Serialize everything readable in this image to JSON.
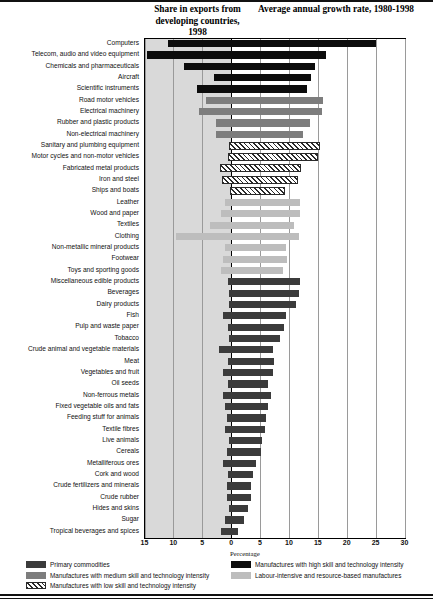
{
  "header": {
    "share_title": "Share in exports from developing countries, 1998",
    "growth_title": "Average annual growth rate, 1980-1998"
  },
  "axis": {
    "xlabel": "Percentage",
    "ticks": [
      "15",
      "10",
      "5",
      "0",
      "5",
      "10",
      "15",
      "20",
      "25",
      "30"
    ],
    "tick_values": [
      -15,
      -10,
      -5,
      0,
      5,
      10,
      15,
      20,
      25,
      30
    ],
    "xlim": [
      -15,
      30
    ]
  },
  "legend": {
    "items": [
      {
        "label": "Primary commodities",
        "key": "primary",
        "color": "#3b3b3b"
      },
      {
        "label": "Manufactures with high skill and technology intensity",
        "key": "high",
        "color": "#0c0c0c"
      },
      {
        "label": "Manufactures with medium skill and technology intensity",
        "key": "medium",
        "color": "#7d7d7d"
      },
      {
        "label": "Labour-intensive and resource-based manufactures",
        "key": "labour",
        "color": "#bdbdbd"
      },
      {
        "label": "Manufactures with low skill and technology intensity",
        "key": "low",
        "color": "#2a2a2a"
      }
    ]
  },
  "chart_data": {
    "type": "bar",
    "xlabel": "Percentage",
    "ylabel": "",
    "xlim": [
      -15,
      30
    ],
    "grid": true,
    "orientation": "horizontal",
    "legend_position": "bottom",
    "note": "Each bar spans from the negative share-in-exports value (left, shaded band) to the positive average annual growth rate (right).",
    "categories": [
      "Computers",
      "Telecom, audio and video equipment",
      "Chemicals and pharmaceuticals",
      "Aircraft",
      "Scientific instruments",
      "Road motor vehicles",
      "Electrical machinery",
      "Rubber and plastic products",
      "Non-electrical machinery",
      "Sanitary and plumbing equipment",
      "Motor cycles and non-motor vehicles",
      "Fabricated metal products",
      "Iron and steel",
      "Ships and boats",
      "Leather",
      "Wood and paper",
      "Textiles",
      "Clothing",
      "Non-metallic mineral products",
      "Footwear",
      "Toys and sporting goods",
      "Miscellaneous edible products",
      "Beverages",
      "Dairy products",
      "Fish",
      "Pulp and waste paper",
      "Tobacco",
      "Crude animal and vegetable materials",
      "Meat",
      "Vegetables and fruit",
      "Oil seeds",
      "Non-ferrous metals",
      "Fixed vegetable oils and fats",
      "Feeding stuff for animals",
      "Textile fibres",
      "Live animals",
      "Cereals",
      "Metalliferous ores",
      "Cork and wood",
      "Crude fertilizers and minerals",
      "Crude rubber",
      "Hides and skins",
      "Sugar",
      "Tropical beverages and spices"
    ],
    "series": [
      {
        "name": "Share in exports from developing countries, 1998",
        "units": "percent",
        "values": [
          11.0,
          14.5,
          8.2,
          3.0,
          6.0,
          4.3,
          5.5,
          2.6,
          2.6,
          0.4,
          0.6,
          2.0,
          1.6,
          0.2,
          1.0,
          1.8,
          3.7,
          9.5,
          1.1,
          1.5,
          1.8,
          0.5,
          0.4,
          0.4,
          1.4,
          0.5,
          0.3,
          2.1,
          0.6,
          1.5,
          0.5,
          1.4,
          1.0,
          0.7,
          1.0,
          0.3,
          0.7,
          1.5,
          0.5,
          0.7,
          0.8,
          0.4,
          1.0,
          1.7
        ]
      },
      {
        "name": "Average annual growth rate, 1980-1998",
        "units": "percent per year",
        "values": [
          25.0,
          16.4,
          14.5,
          13.8,
          13.2,
          15.9,
          15.8,
          13.7,
          12.4,
          15.3,
          15.0,
          12.1,
          11.6,
          9.4,
          11.9,
          11.9,
          10.8,
          11.8,
          9.5,
          9.6,
          8.9,
          11.9,
          11.8,
          11.3,
          9.5,
          9.2,
          8.4,
          7.3,
          7.5,
          7.3,
          6.3,
          6.9,
          6.3,
          6.0,
          5.9,
          5.3,
          5.1,
          4.3,
          3.7,
          3.4,
          3.4,
          2.9,
          2.3,
          1.1
        ]
      }
    ],
    "category_class": [
      "high",
      "high",
      "high",
      "high",
      "high",
      "medium",
      "medium",
      "medium",
      "medium",
      "low",
      "low",
      "low",
      "low",
      "low",
      "labour",
      "labour",
      "labour",
      "labour",
      "labour",
      "labour",
      "labour",
      "primary",
      "primary",
      "primary",
      "primary",
      "primary",
      "primary",
      "primary",
      "primary",
      "primary",
      "primary",
      "primary",
      "primary",
      "primary",
      "primary",
      "primary",
      "primary",
      "primary",
      "primary",
      "primary",
      "primary",
      "primary",
      "primary",
      "primary"
    ]
  }
}
